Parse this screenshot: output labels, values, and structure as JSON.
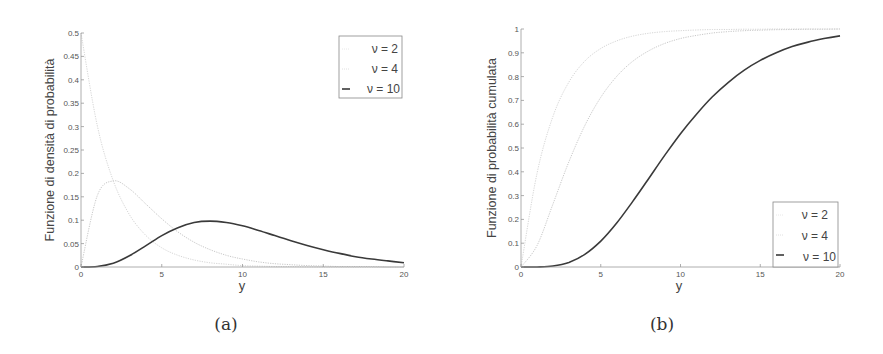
{
  "chart_data": [
    {
      "type": "line",
      "panel_caption": "(a)",
      "title": "",
      "xlabel": "y",
      "ylabel": "Funzione di densità di probabilità",
      "xlim": [
        0,
        20
      ],
      "ylim": [
        0,
        0.5
      ],
      "xticks": [
        "0",
        "5",
        "10",
        "15",
        "20"
      ],
      "yticks": [
        "0",
        "0.05",
        "0.1",
        "0.15",
        "0.2",
        "0.25",
        "0.3",
        "0.35",
        "0.4",
        "0.45",
        "0.5"
      ],
      "grid": false,
      "legend_position": "upper right",
      "x": [
        0,
        1,
        2,
        3,
        4,
        5,
        6,
        7,
        8,
        9,
        10,
        11,
        12,
        13,
        14,
        15,
        16,
        17,
        18,
        19,
        20
      ],
      "series": [
        {
          "name": "ν = 2",
          "color": "#d0d0d0",
          "values": [
            0.5,
            0.303,
            0.184,
            0.112,
            0.068,
            0.041,
            0.025,
            0.015,
            0.009,
            0.006,
            0.003,
            0.002,
            0.001,
            0.001,
            0.0005,
            0.0003,
            0.0002,
            0.0001,
            0.0001,
            0.0,
            0.0
          ]
        },
        {
          "name": "ν = 4",
          "color": "#c4c4c4",
          "values": [
            0.0,
            0.152,
            0.184,
            0.167,
            0.135,
            0.103,
            0.075,
            0.053,
            0.037,
            0.025,
            0.017,
            0.011,
            0.007,
            0.005,
            0.003,
            0.002,
            0.001,
            0.001,
            0.001,
            0.0,
            0.0
          ]
        },
        {
          "name": "ν = 10",
          "color": "#3a3a3a",
          "values": [
            0.0,
            0.001,
            0.008,
            0.024,
            0.045,
            0.067,
            0.084,
            0.095,
            0.098,
            0.095,
            0.088,
            0.078,
            0.067,
            0.056,
            0.046,
            0.037,
            0.029,
            0.022,
            0.017,
            0.013,
            0.009
          ]
        }
      ]
    },
    {
      "type": "line",
      "panel_caption": "(b)",
      "title": "",
      "xlabel": "y",
      "ylabel": "Funzione di probabilità cumulata",
      "xlim": [
        0,
        20
      ],
      "ylim": [
        0,
        1
      ],
      "xticks": [
        "0",
        "5",
        "10",
        "15",
        "20"
      ],
      "yticks": [
        "0",
        "0.1",
        "0.2",
        "0.3",
        "0.4",
        "0.5",
        "0.6",
        "0.7",
        "0.8",
        "0.9",
        "1"
      ],
      "grid": false,
      "legend_position": "lower right",
      "x": [
        0,
        1,
        2,
        3,
        4,
        5,
        6,
        7,
        8,
        9,
        10,
        11,
        12,
        13,
        14,
        15,
        16,
        17,
        18,
        19,
        20
      ],
      "series": [
        {
          "name": "ν = 2",
          "color": "#d0d0d0",
          "values": [
            0.0,
            0.393,
            0.632,
            0.777,
            0.865,
            0.918,
            0.95,
            0.97,
            0.982,
            0.989,
            0.993,
            0.996,
            0.998,
            0.998,
            0.999,
            0.999,
            1.0,
            1.0,
            1.0,
            1.0,
            1.0
          ]
        },
        {
          "name": "ν = 4",
          "color": "#c4c4c4",
          "values": [
            0.0,
            0.09,
            0.264,
            0.442,
            0.594,
            0.713,
            0.801,
            0.864,
            0.908,
            0.939,
            0.96,
            0.973,
            0.983,
            0.989,
            0.993,
            0.995,
            0.997,
            0.998,
            0.999,
            0.999,
            1.0
          ]
        },
        {
          "name": "ν = 10",
          "color": "#3a3a3a",
          "values": [
            0.0,
            0.0002,
            0.004,
            0.019,
            0.053,
            0.109,
            0.185,
            0.275,
            0.371,
            0.468,
            0.56,
            0.642,
            0.715,
            0.776,
            0.827,
            0.868,
            0.9,
            0.926,
            0.945,
            0.96,
            0.971
          ]
        }
      ]
    }
  ],
  "panels": [
    {
      "caption": "(a)",
      "xlabel": "y",
      "ylabel": "Funzione di densità di probabilità",
      "legend": [
        "ν = 2",
        "ν = 4",
        "ν = 10"
      ]
    },
    {
      "caption": "(b)",
      "xlabel": "y",
      "ylabel": "Funzione di probabilità cumulata",
      "legend": [
        "ν = 2",
        "ν = 4",
        "ν = 10"
      ]
    }
  ]
}
